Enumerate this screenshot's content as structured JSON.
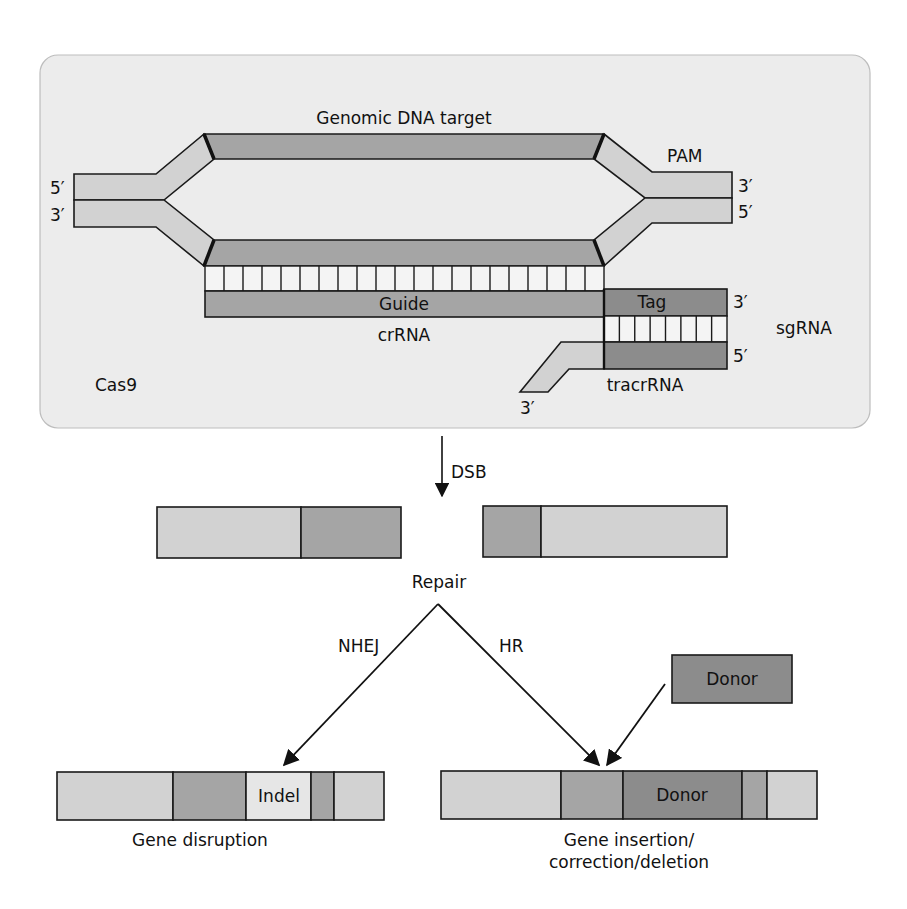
{
  "colors": {
    "panel_bg": "#ececec",
    "strand_light": "#d2d2d2",
    "strand_mid": "#a5a5a5",
    "strand_dark": "#8c8c8c",
    "indel_fill": "#e6e6e6",
    "stroke": "#1a1a1a"
  },
  "panel": {
    "title": "Genomic DNA target",
    "pam_label": "PAM",
    "left_top_end": "5′",
    "left_bottom_end": "3′",
    "right_top_end": "3′",
    "right_bottom_end": "5′",
    "guide_label": "Guide",
    "crrna_label": "crRNA",
    "tag_label": "Tag",
    "tag_end": "3′",
    "tracr_end": "5′",
    "sgrna_label": "sgRNA",
    "tracrrna_label": "tracrRNA",
    "tracr_tail_end": "3′",
    "cas9_label": "Cas9",
    "ladder_rungs": 21,
    "tag_rungs": 8
  },
  "dsb": {
    "label": "DSB"
  },
  "repair": {
    "label": "Repair",
    "nhej_label": "NHEJ",
    "hr_label": "HR",
    "donor_label": "Donor"
  },
  "outcomes": {
    "disruption": {
      "indel_label": "Indel",
      "caption": "Gene disruption"
    },
    "insertion": {
      "donor_label": "Donor",
      "caption_line1": "Gene insertion/",
      "caption_line2": "correction/deletion"
    }
  }
}
